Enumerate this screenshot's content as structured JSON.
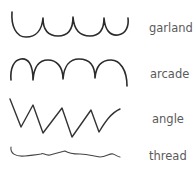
{
  "diagram": {
    "type": "handwriting-connection-forms",
    "stroke_color": "#2b2b2b",
    "label_color": "#5a5a5a",
    "items": [
      {
        "label": "garland",
        "shape": "cup-shaped connections (u-u-u-u)"
      },
      {
        "label": "arcade",
        "shape": "arch-shaped connections (n-n-n-n)"
      },
      {
        "label": "angle",
        "shape": "zig-zag angular connections"
      },
      {
        "label": "thread",
        "shape": "flat wavy thread line"
      }
    ]
  }
}
